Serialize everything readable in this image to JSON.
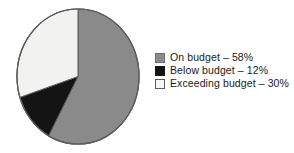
{
  "chart_data": {
    "type": "pie",
    "title": "",
    "subtitle": "",
    "xlabel": "",
    "ylabel": "",
    "grid": false,
    "legend_position": "right",
    "start_angle_deg": 0,
    "direction": "clockwise",
    "categories": [
      "On budget",
      "Below budget",
      "Exceeding budget"
    ],
    "values": [
      58,
      12,
      30
    ],
    "units": "percent",
    "total": 100,
    "slices": [
      {
        "label": "On budget",
        "value": 58,
        "value_text": "58%",
        "legend_text": "On budget – 58%",
        "color": "#8a8a8a",
        "swatch": "sw-gray",
        "start_deg": 0,
        "end_deg": 208.8,
        "sweep_deg": 208.8
      },
      {
        "label": "Below budget",
        "value": 12,
        "value_text": "12%",
        "legend_text": "Below budget – 12%",
        "color": "#141414",
        "swatch": "sw-black",
        "start_deg": 208.8,
        "end_deg": 252.0,
        "sweep_deg": 43.2
      },
      {
        "label": "Exceeding budget",
        "value": 30,
        "value_text": "30%",
        "legend_text": "Exceeding budget – 30%",
        "color": "#f2f2f0",
        "swatch": "sw-white",
        "start_deg": 252.0,
        "end_deg": 360.0,
        "sweep_deg": 108.0
      }
    ],
    "colors": {
      "on_budget": "#8a8a8a",
      "below_budget": "#141414",
      "exceeding_budget": "#f2f2f0",
      "outline": "#5d5d5d",
      "background": "#ffffff",
      "text": "#1b1b1b"
    }
  },
  "legend": {
    "items": [
      {
        "label": "On budget – 58%",
        "swatch": "sw-gray"
      },
      {
        "label": "Below budget – 12%",
        "swatch": "sw-black"
      },
      {
        "label": "Exceeding budget – 30%",
        "swatch": "sw-white"
      }
    ]
  }
}
